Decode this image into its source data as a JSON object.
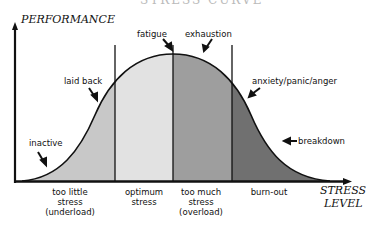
{
  "title": "STRESS CURVE",
  "axes": {
    "y_label": "PERFORMANCE",
    "x_label_line1": "STRESS",
    "x_label_line2": "LEVEL"
  },
  "zones": [
    {
      "line1": "too little",
      "line2": "stress",
      "line3": "(underload)",
      "color": "#c8c8c8"
    },
    {
      "line1": "optimum",
      "line2": "stress",
      "line3": "",
      "color": "#e2e2e2"
    },
    {
      "line1": "too much",
      "line2": "stress",
      "line3": "(overload)",
      "color": "#9e9e9e"
    },
    {
      "line1": "burn-out",
      "line2": "",
      "line3": "",
      "color": "#707070"
    }
  ],
  "annotations": {
    "inactive": "inactive",
    "laid_back": "laid back",
    "fatigue": "fatigue",
    "exhaustion": "exhaustion",
    "anxiety": "anxiety/panic/anger",
    "breakdown": "breakdown"
  }
}
